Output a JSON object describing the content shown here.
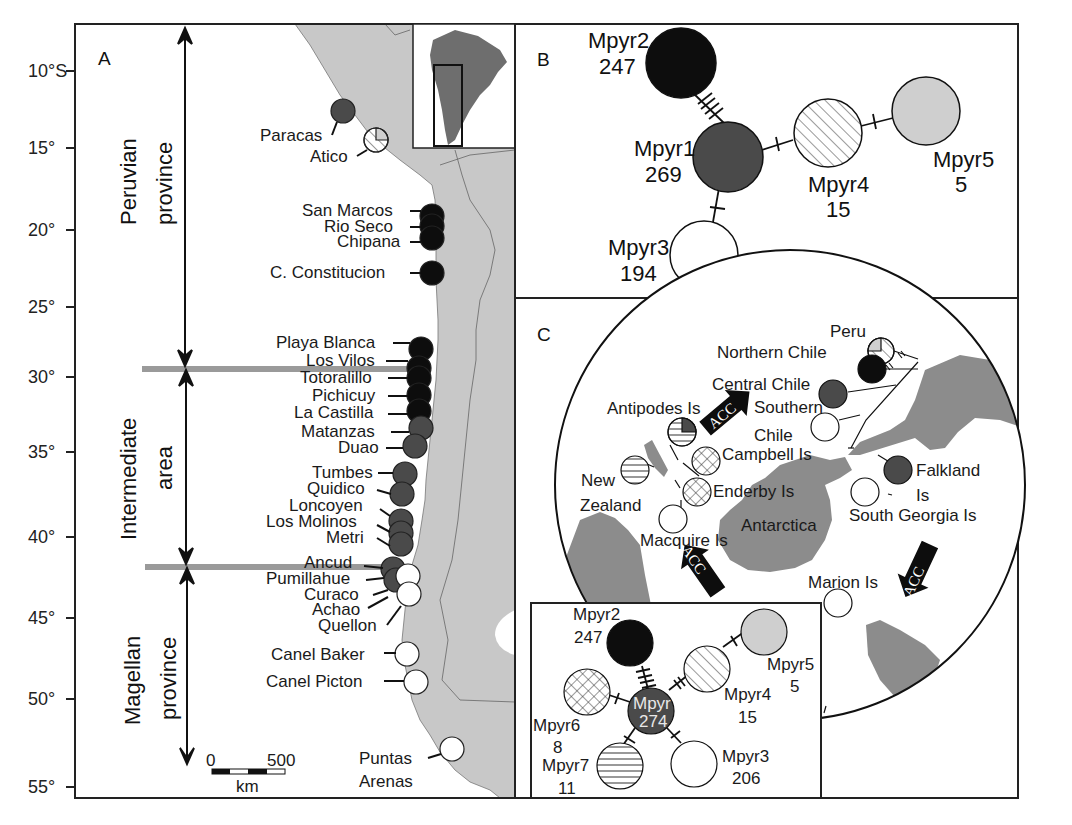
{
  "figure": {
    "panel_a": {
      "label": "A",
      "y_axis_ticks": [
        "10°S",
        "15°",
        "20°",
        "25°",
        "30°",
        "35°",
        "40°",
        "45°",
        "50°",
        "55°"
      ],
      "regions": [
        {
          "line1": "Peruvian",
          "line2": "province"
        },
        {
          "line1": "Intermediate",
          "line2": "area"
        },
        {
          "line1": "Magellan",
          "line2": "province"
        }
      ],
      "scale_bar": {
        "start": "0",
        "end": "500",
        "unit": "km"
      },
      "sites": [
        {
          "name": "Paracas",
          "fill": "#4a4a4a"
        },
        {
          "name": "Atico",
          "fill": "mixed"
        },
        {
          "name": "San Marcos",
          "fill": "#0d0d0d"
        },
        {
          "name": "Rio Seco",
          "fill": "#0d0d0d"
        },
        {
          "name": "Chipana",
          "fill": "#0d0d0d"
        },
        {
          "name": "C. Constitucion",
          "fill": "#0d0d0d"
        },
        {
          "name": "Playa Blanca",
          "fill": "#0d0d0d"
        },
        {
          "name": "Los Vilos",
          "fill": "#0d0d0d"
        },
        {
          "name": "Totoralillo",
          "fill": "#0d0d0d"
        },
        {
          "name": "Pichicuy",
          "fill": "#0d0d0d"
        },
        {
          "name": "La Castilla",
          "fill": "#0d0d0d"
        },
        {
          "name": "Matanzas",
          "fill": "#4a4a4a"
        },
        {
          "name": "Duao",
          "fill": "#4a4a4a"
        },
        {
          "name": "Tumbes",
          "fill": "#4a4a4a"
        },
        {
          "name": "Quidico",
          "fill": "#4a4a4a"
        },
        {
          "name": "Loncoyen",
          "fill": "#4a4a4a"
        },
        {
          "name": "Los Molinos",
          "fill": "#4a4a4a"
        },
        {
          "name": "Metri",
          "fill": "#4a4a4a"
        },
        {
          "name": "Ancud",
          "fill": "#4a4a4a"
        },
        {
          "name": "Pumillahue",
          "fill": "#ffffff"
        },
        {
          "name": "Curaco",
          "fill": "#ffffff"
        },
        {
          "name": "Achao",
          "fill": "#4a4a4a"
        },
        {
          "name": "Quellon",
          "fill": "#ffffff"
        },
        {
          "name": "Canel Baker",
          "fill": "#ffffff"
        },
        {
          "name": "Canel Picton",
          "fill": "#ffffff"
        },
        {
          "name": "Puntas",
          "fill": "#ffffff"
        },
        {
          "name": "Arenas",
          "fill": ""
        }
      ]
    },
    "panel_b": {
      "label": "B",
      "haplotypes": [
        {
          "name": "Mpyr1",
          "count": "269"
        },
        {
          "name": "Mpyr2",
          "count": "247"
        },
        {
          "name": "Mpyr3",
          "count": "194"
        },
        {
          "name": "Mpyr4",
          "count": "15"
        },
        {
          "name": "Mpyr5",
          "count": "5"
        }
      ]
    },
    "panel_c": {
      "label": "C",
      "places": {
        "peru": "Peru",
        "northern_chile": "Northern Chile",
        "central_chile": "Central Chile",
        "southern": "Southern",
        "chile": "Chile",
        "antipodes": "Antipodes Is",
        "campbell": "Campbell Is",
        "new": "New",
        "zealand": "Zealand",
        "enderby": "Enderby Is",
        "antarctica": "Antarctica",
        "macquire": "Macquire Is",
        "falkland": "Falkland",
        "is": "Is",
        "south_georgia": "South Georgia Is",
        "marion": "Marion Is"
      },
      "current_label": "ACC",
      "inset_haplotypes": [
        {
          "name": "Mpyr",
          "count": "274"
        },
        {
          "name": "Mpyr2",
          "count": "247"
        },
        {
          "name": "Mpyr3",
          "count": "206"
        },
        {
          "name": "Mpyr4",
          "count": "15"
        },
        {
          "name": "Mpyr5",
          "count": "5"
        },
        {
          "name": "Mpyr6",
          "count": "8"
        },
        {
          "name": "Mpyr7",
          "count": "11"
        }
      ]
    },
    "colors": {
      "land": "#c8c8c8",
      "land_dark": "#8c8c8c",
      "mpyr1": "#4a4a4a",
      "mpyr2": "#0d0d0d",
      "mpyr3": "#ffffff",
      "mpyr5": "#cfcfcf",
      "boundary_bar": "#9a9a9a"
    }
  }
}
